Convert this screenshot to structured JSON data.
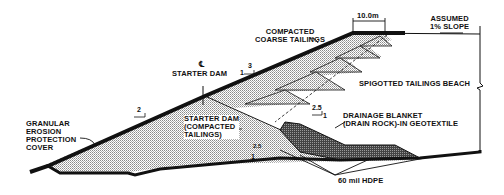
{
  "labels": {
    "compacted_coarse_tailings": "COMPACTED\nCOARSE TAILINGS",
    "width_dimension": "10.0m",
    "assumed_slope": "ASSUMED\n1% SLOPE",
    "starter_dam_centerline_symbol": "℄",
    "starter_dam_centerline": "STARTER DAM",
    "spigotted_beach": "SPIGOTTED TAILINGS BEACH",
    "granular_cover": "GRANULAR\nEROSION\nPROTECTION\nCOVER",
    "starter_dam_body": "STARTER DAM\n(COMPACTED\nTAILINGS)",
    "drainage_blanket": "DRAINAGE BLANKET\n(DRAIN ROCK)-IN GEOTEXTILE",
    "liner": "60 mil HDPE"
  },
  "slopes": {
    "upper_outer": {
      "rise": "1",
      "run": "3"
    },
    "lower_outer": {
      "rise": "1",
      "run": "2"
    },
    "inner_starter": {
      "rise": "1",
      "run": "2.5"
    },
    "drain": {
      "rise": "1",
      "run": "2.5"
    }
  },
  "colors": {
    "line": "#111111",
    "fill_stipple": "#b8b8b8",
    "background": "#ffffff"
  }
}
